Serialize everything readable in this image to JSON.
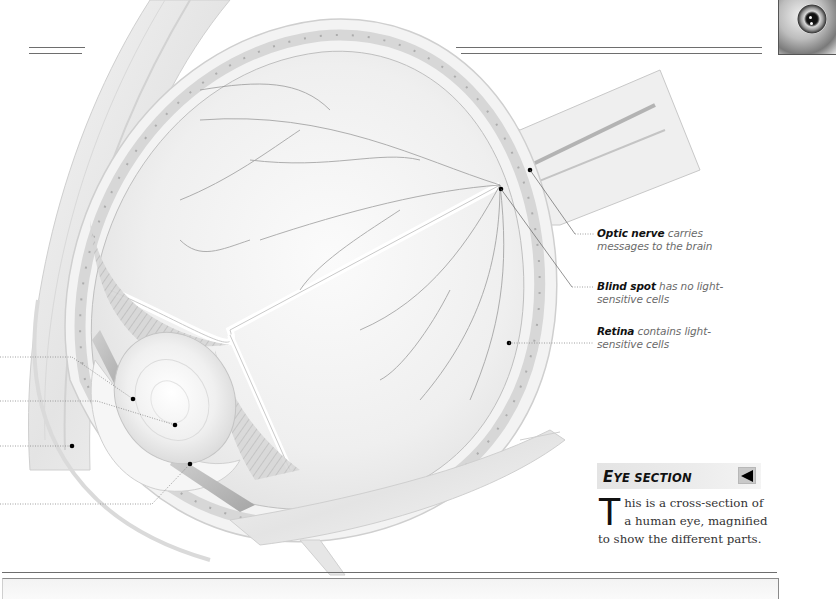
{
  "page": {
    "background": "#ffffff",
    "rule_color": "#6e6e6e"
  },
  "thumbnail": {
    "icon": "eye-closeup-thumbnail"
  },
  "illustration": {
    "subject": "cross-section of a human eye",
    "left_callouts": [
      {
        "id": "callout-1",
        "label": ""
      },
      {
        "id": "callout-2",
        "label": ""
      },
      {
        "id": "callout-3",
        "label": ""
      },
      {
        "id": "callout-4",
        "label": ""
      }
    ]
  },
  "labels": [
    {
      "term": "Optic nerve",
      "text": " carries",
      "line2": "messages to the brain"
    },
    {
      "term": "Blind spot",
      "text": " has no light-",
      "line2": "sensitive cells"
    },
    {
      "term": "Retina",
      "text": " contains light-",
      "line2": "sensitive cells"
    }
  ],
  "section": {
    "title_first": "E",
    "title_rest_1": "YE ",
    "title_rest_2": "SECTION",
    "back_button": "back-arrow",
    "drop_cap": "T",
    "body": "his is a cross-section of a human eye, magnified to show the different parts."
  },
  "colors": {
    "heading_bar": "#e6e6e6",
    "heading_text": "#111111",
    "label_term": "#111111",
    "label_text": "#6a6a6a",
    "body_text": "#333333"
  }
}
